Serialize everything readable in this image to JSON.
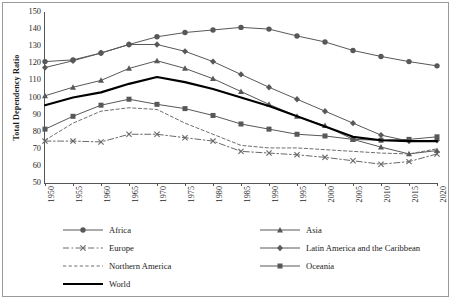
{
  "chart_data": {
    "type": "line",
    "title": "",
    "xlabel": "",
    "ylabel": "Total Dependency Ratio",
    "ylim": [
      50,
      150
    ],
    "ytick_step": 10,
    "yticks": [
      50,
      60,
      70,
      80,
      90,
      100,
      110,
      120,
      130,
      140,
      150
    ],
    "grid": false,
    "legend_position": "bottom",
    "x": [
      1950,
      1955,
      1960,
      1965,
      1970,
      1975,
      1980,
      1985,
      1990,
      1995,
      2000,
      2005,
      2010,
      2015,
      2020
    ],
    "categories": [
      "1950",
      "1955",
      "1960",
      "1965",
      "1970",
      "1975",
      "1980",
      "1985",
      "1990",
      "1995",
      "2000",
      "2005",
      "2010",
      "2015",
      "2020"
    ],
    "series": [
      {
        "name": "Africa",
        "marker": "circle",
        "dash": "solid",
        "color": "#585858",
        "width": 1,
        "values": [
          121,
          122,
          126,
          131,
          135.5,
          138,
          139.5,
          141,
          140,
          136,
          132.5,
          127.5,
          124,
          121,
          118.5
        ]
      },
      {
        "name": "Asia",
        "marker": "triangle",
        "dash": "solid",
        "color": "#585858",
        "width": 1,
        "values": [
          101,
          106,
          110,
          117,
          121.5,
          117,
          111,
          103.5,
          96,
          89,
          83.5,
          75.5,
          71,
          67,
          69
        ]
      },
      {
        "name": "Europe",
        "marker": "cross",
        "dash": "dashdot",
        "color": "#686868",
        "width": 1,
        "values": [
          74.5,
          74.5,
          74,
          78.5,
          78.5,
          76.5,
          74.5,
          68.5,
          67.5,
          66.5,
          65,
          63,
          61,
          62.5,
          67
        ]
      },
      {
        "name": "Latin America and the Caribbean",
        "marker": "diamond",
        "dash": "solid",
        "color": "#585858",
        "width": 1,
        "values": [
          117.5,
          121.5,
          126,
          131,
          131,
          127,
          121,
          113.5,
          106,
          99,
          92,
          85,
          78,
          74.5,
          75
        ]
      },
      {
        "name": "Northern America",
        "marker": "none",
        "dash": "dashed",
        "color": "#6e6e6e",
        "width": 1,
        "values": [
          75,
          85,
          92,
          94,
          93,
          85,
          78.5,
          72,
          70.5,
          70.5,
          69.5,
          68.5,
          67.5,
          67,
          70
        ]
      },
      {
        "name": "Oceania",
        "marker": "square",
        "dash": "solid",
        "color": "#585858",
        "width": 1,
        "values": [
          81.5,
          89,
          95.5,
          99,
          96,
          93.5,
          89.5,
          84.5,
          81.5,
          78.5,
          77.5,
          75.5,
          75,
          75.5,
          77
        ]
      },
      {
        "name": "World",
        "marker": "none",
        "dash": "solid",
        "color": "#000000",
        "width": 2.2,
        "values": [
          95.5,
          100,
          103,
          108,
          112,
          109,
          105,
          100,
          95,
          89,
          83,
          77,
          75,
          74.5,
          74.5
        ]
      }
    ]
  },
  "axis": {
    "y_title": "Total Dependency Ratio"
  },
  "legend": {
    "items": [
      {
        "label": "Africa"
      },
      {
        "label": "Asia"
      },
      {
        "label": "Europe"
      },
      {
        "label": "Latin America and the Caribbean"
      },
      {
        "label": "Northern America"
      },
      {
        "label": "Oceania"
      },
      {
        "label": "World"
      }
    ]
  }
}
